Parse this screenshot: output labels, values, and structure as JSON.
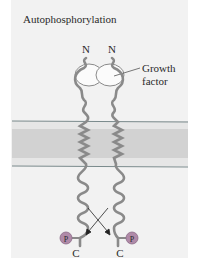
{
  "figure": {
    "title": "Autophosphorylation",
    "labels": {
      "n_terminus_left": "N",
      "n_terminus_right": "N",
      "growth_factor_line1": "Growth",
      "growth_factor_line2": "factor",
      "c_terminus_left": "C",
      "c_terminus_right": "C",
      "phosphate_left": "P",
      "phosphate_right": "P"
    },
    "colors": {
      "background": "#f2f2f2",
      "membrane_outer": "#e6e6e6",
      "membrane_core": "#d2d2d2",
      "membrane_line": "#7a8a8c",
      "protein": "#8a8a8a",
      "phosphate": "#b08aa8"
    }
  }
}
